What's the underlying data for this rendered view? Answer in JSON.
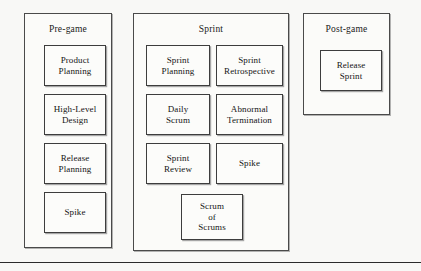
{
  "figure": {
    "type": "scrum-process-diagram",
    "background_color": "#f8f8f6",
    "border_color": "#3d3d3d",
    "box_fill_color": "#fcfcfa",
    "text_color": "#141414"
  },
  "phases": [
    {
      "id": "pre-game",
      "title": "Pre-game",
      "rect": {
        "x": 24,
        "y": 13,
        "w": 88,
        "h": 235
      },
      "title_y": 24,
      "nodes": [
        {
          "id": "product-planning",
          "label": "Product\nPlanning",
          "rect": {
            "x": 44,
            "y": 45,
            "w": 62,
            "h": 41
          }
        },
        {
          "id": "high-level-design",
          "label": "High-Level\nDesign",
          "rect": {
            "x": 44,
            "y": 94,
            "w": 62,
            "h": 41
          }
        },
        {
          "id": "release-planning",
          "label": "Release\nPlanning",
          "rect": {
            "x": 44,
            "y": 143,
            "w": 62,
            "h": 41
          }
        },
        {
          "id": "spike-pre-game",
          "label": "Spike",
          "rect": {
            "x": 44,
            "y": 192,
            "w": 62,
            "h": 41
          }
        }
      ]
    },
    {
      "id": "sprint",
      "title": "Sprint",
      "rect": {
        "x": 133,
        "y": 13,
        "w": 156,
        "h": 238
      },
      "title_y": 24,
      "nodes": [
        {
          "id": "sprint-planning",
          "label": "Sprint\nPlanning",
          "rect": {
            "x": 146,
            "y": 45,
            "w": 64,
            "h": 41
          }
        },
        {
          "id": "sprint-retrospective",
          "label": "Sprint\nRetrospective",
          "rect": {
            "x": 216,
            "y": 45,
            "w": 67,
            "h": 41
          }
        },
        {
          "id": "daily-scrum",
          "label": "Daily\nScrum",
          "rect": {
            "x": 146,
            "y": 94,
            "w": 64,
            "h": 41
          }
        },
        {
          "id": "abnormal-termination",
          "label": "Abnormal\nTermination",
          "rect": {
            "x": 216,
            "y": 94,
            "w": 67,
            "h": 41
          }
        },
        {
          "id": "sprint-review",
          "label": "Sprint\nReview",
          "rect": {
            "x": 146,
            "y": 143,
            "w": 64,
            "h": 41
          }
        },
        {
          "id": "spike-sprint",
          "label": "Spike",
          "rect": {
            "x": 216,
            "y": 143,
            "w": 67,
            "h": 41
          }
        },
        {
          "id": "scrum-of-scrums",
          "label": "Scrum\nof\nScrums",
          "rect": {
            "x": 181,
            "y": 194,
            "w": 62,
            "h": 46
          }
        }
      ]
    },
    {
      "id": "post-game",
      "title": "Post-game",
      "rect": {
        "x": 303,
        "y": 13,
        "w": 87,
        "h": 102
      },
      "title_y": 24,
      "nodes": [
        {
          "id": "release-sprint",
          "label": "Release\nSprint",
          "rect": {
            "x": 320,
            "y": 50,
            "w": 62,
            "h": 41
          }
        }
      ]
    }
  ],
  "bottom_rule": {
    "y": 262
  }
}
